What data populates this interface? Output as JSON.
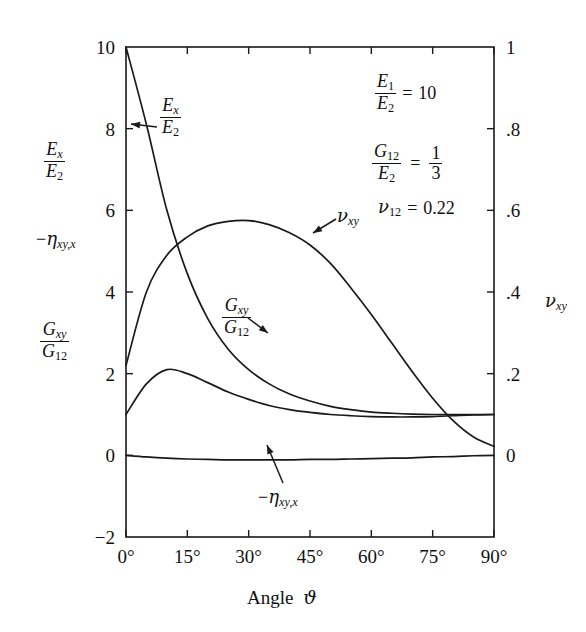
{
  "figure": {
    "xlabel_prefix": "Angle",
    "xlabel_symbol": "ϑ",
    "right_axis_title": "νxy"
  },
  "left_axis": {
    "ticks": [
      "10",
      "8",
      "6",
      "4",
      "2",
      "0",
      "−2"
    ],
    "values": [
      10,
      8,
      6,
      4,
      2,
      0,
      -2
    ],
    "titles": [
      {
        "num": "Ex",
        "den": "E2"
      },
      {
        "plain": "−ηxy,x"
      },
      {
        "num": "Gxy",
        "den": "G12"
      }
    ]
  },
  "right_axis": {
    "ticks": [
      "1",
      ".8",
      ".6",
      ".4",
      ".2",
      "0"
    ],
    "values": [
      1,
      0.8,
      0.6,
      0.4,
      0.2,
      0
    ]
  },
  "x_axis": {
    "ticks": [
      "0°",
      "15°",
      "30°",
      "45°",
      "60°",
      "75°",
      "90°"
    ],
    "values": [
      0,
      15,
      30,
      45,
      60,
      75,
      90
    ]
  },
  "annotations": {
    "params": [
      {
        "num": "E1",
        "den": "E2",
        "eq": "=",
        "rhs": "10"
      },
      {
        "num": "G12",
        "den": "E2",
        "eq": "=",
        "rhs_num": "1",
        "rhs_den": "3"
      },
      {
        "lhs": "ν12",
        "eq": "=",
        "rhs": "0.22"
      }
    ],
    "curve_labels": [
      {
        "name": "Ex/E2",
        "num": "Ex",
        "den": "E2"
      },
      {
        "name": "Gxy/G12",
        "num": "Gxy",
        "den": "G12"
      },
      {
        "name": "nu_xy",
        "plain": "νxy"
      },
      {
        "name": "minus-eta",
        "plain": "−ηxy,x"
      }
    ]
  },
  "chart_data": {
    "type": "line",
    "title": "",
    "xlabel": "Angle ϑ",
    "ylabel": "Ex/E2, −ηxy,x, Gxy/G12",
    "ylabel_right": "νxy",
    "xlim": [
      0,
      90
    ],
    "ylim": [
      -2,
      10
    ],
    "ylim_right": [
      -0.2,
      1.0
    ],
    "grid": false,
    "legend": "in-plot arrow annotations",
    "xticks": [
      0,
      15,
      30,
      45,
      60,
      75,
      90
    ],
    "yticks": [
      -2,
      0,
      2,
      4,
      6,
      8,
      10
    ],
    "yticks_right": [
      0,
      0.2,
      0.4,
      0.6,
      0.8,
      1.0
    ],
    "x": [
      0,
      5,
      10,
      15,
      20,
      25,
      30,
      35,
      40,
      45,
      50,
      55,
      60,
      65,
      70,
      75,
      80,
      85,
      90
    ],
    "series": [
      {
        "name": "Ex/E2",
        "axis": "left",
        "values": [
          10.0,
          8.1,
          6.0,
          4.45,
          3.35,
          2.6,
          2.1,
          1.75,
          1.5,
          1.33,
          1.2,
          1.12,
          1.06,
          1.03,
          1.01,
          1.0,
          1.0,
          1.0,
          1.0
        ]
      },
      {
        "name": "Gxy/G12",
        "axis": "left",
        "values": [
          1.0,
          1.75,
          2.1,
          2.0,
          1.78,
          1.55,
          1.37,
          1.22,
          1.12,
          1.05,
          1.0,
          0.97,
          0.95,
          0.94,
          0.94,
          0.95,
          0.97,
          0.99,
          1.0
        ]
      },
      {
        "name": "νxy",
        "axis": "right",
        "values": [
          0.22,
          0.4,
          0.49,
          0.535,
          0.562,
          0.573,
          0.575,
          0.565,
          0.545,
          0.515,
          0.47,
          0.41,
          0.345,
          0.275,
          0.205,
          0.14,
          0.085,
          0.045,
          0.022
        ]
      },
      {
        "name": "−ηxy,x",
        "axis": "left",
        "values": [
          0.0,
          -0.04,
          -0.07,
          -0.09,
          -0.1,
          -0.11,
          -0.11,
          -0.11,
          -0.11,
          -0.1,
          -0.1,
          -0.09,
          -0.08,
          -0.07,
          -0.06,
          -0.04,
          -0.03,
          -0.01,
          0.0
        ]
      }
    ]
  }
}
